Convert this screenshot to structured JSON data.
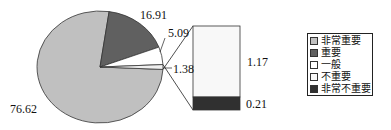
{
  "chart_data": {
    "type": "pie",
    "subtype": "bar-of-pie",
    "title": "",
    "categories": [
      "非常重要",
      "重要",
      "一般",
      "不重要",
      "非常不重要"
    ],
    "values": [
      76.62,
      16.91,
      5.09,
      1.17,
      0.21
    ],
    "pie_labels": [
      "76.62",
      "16.91",
      "5.09",
      "1.38"
    ],
    "pie_slices": [
      {
        "name": "非常重要",
        "value": 76.62,
        "color": "#c0c0c0"
      },
      {
        "name": "重要",
        "value": 16.91,
        "color": "#606060"
      },
      {
        "name": "一般",
        "value": 5.09,
        "color": "#ffffff"
      },
      {
        "name": "其他(不重要+非常不重要)",
        "value": 1.38,
        "color": "#f0f0f0"
      }
    ],
    "bar_segments": [
      {
        "name": "不重要",
        "value": 1.17,
        "label": "1.17",
        "color": "#f8f8f8"
      },
      {
        "name": "非常不重要",
        "value": 0.21,
        "label": "0.21",
        "color": "#303030"
      }
    ],
    "legend": {
      "position": "right",
      "entries": [
        {
          "label": "非常重要",
          "color": "#c0c0c0"
        },
        {
          "label": "重要",
          "color": "#606060"
        },
        {
          "label": "一般",
          "color": "#ffffff"
        },
        {
          "label": "不重要",
          "color": "#f8f8f8"
        },
        {
          "label": "非常不重要",
          "color": "#303030"
        }
      ]
    },
    "xlabel": "",
    "ylabel": ""
  }
}
